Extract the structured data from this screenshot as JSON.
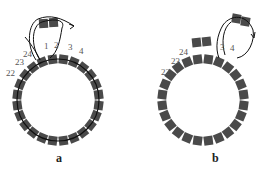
{
  "colors": {
    "bead": "#4a4a4a",
    "thread": "#111111",
    "label": "#555555",
    "background": "#ffffff"
  },
  "panels": [
    {
      "id": "a",
      "caption": "a",
      "ring_beads": 24,
      "thread_through_ring": true,
      "labels": {
        "b1": "1",
        "b2": "2",
        "b3": "3",
        "b4": "4",
        "b22": "22",
        "b23": "23",
        "b24": "24"
      },
      "description": "Ring of 24 beads with thread; two new beads added above beads 1 and 2, thread loops back through with arrow"
    },
    {
      "id": "b",
      "caption": "b",
      "ring_beads": 24,
      "thread_through_ring": false,
      "labels": {
        "b3": "3",
        "b4": "4",
        "b22": "22",
        "b23": "23",
        "b24": "24"
      },
      "description": "Beads stacked above 1 and 2; two new beads added above beads 3 and 4 with thread loop and arrow"
    }
  ]
}
